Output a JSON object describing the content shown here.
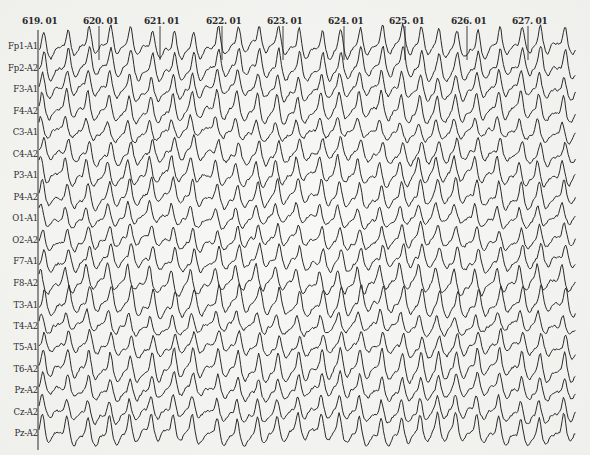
{
  "recording": {
    "type": "EEG",
    "montage": "referential (ear reference A1/A2)",
    "trace_color": "#2b2b2b",
    "background_color": "#f3f3f1"
  },
  "time_axis": {
    "markers": [
      {
        "label": "619. 01",
        "x": 38
      },
      {
        "label": "620. 01",
        "x": 99
      },
      {
        "label": "621. 01",
        "x": 160
      },
      {
        "label": "622. 01",
        "x": 222
      },
      {
        "label": "623. 01",
        "x": 283
      },
      {
        "label": "624. 01",
        "x": 344
      },
      {
        "label": "625. 01",
        "x": 405
      },
      {
        "label": "626. 01",
        "x": 467
      },
      {
        "label": "627. 01",
        "x": 528
      }
    ],
    "x_start": 38,
    "x_end": 576
  },
  "channels": [
    {
      "label": "Fp1-A1",
      "y": 46
    },
    {
      "label": "Fp2-A2",
      "y": 68
    },
    {
      "label": "F3-A1",
      "y": 89
    },
    {
      "label": "F4-A2",
      "y": 111
    },
    {
      "label": "C3-A1",
      "y": 132
    },
    {
      "label": "C4-A2",
      "y": 154
    },
    {
      "label": "P3-A1",
      "y": 175
    },
    {
      "label": "P4-A2",
      "y": 197
    },
    {
      "label": "O1-A1",
      "y": 218
    },
    {
      "label": "O2-A2",
      "y": 240
    },
    {
      "label": "F7-A1",
      "y": 261
    },
    {
      "label": "F8-A2",
      "y": 283
    },
    {
      "label": "T3-A1",
      "y": 305
    },
    {
      "label": "T4-A2",
      "y": 326
    },
    {
      "label": "T5-A1",
      "y": 347
    },
    {
      "label": "T6-A2",
      "y": 369
    },
    {
      "label": "Pz-A2",
      "y": 390
    },
    {
      "label": "Cz-A2",
      "y": 412
    },
    {
      "label": "Pz-A2",
      "y": 433
    }
  ]
}
